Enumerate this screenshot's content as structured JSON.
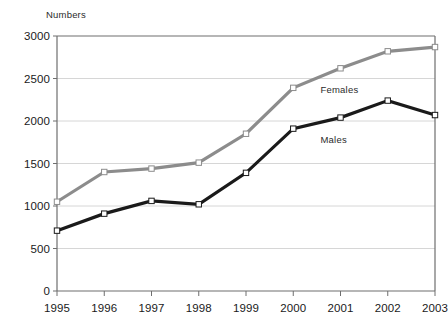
{
  "chart_data": {
    "type": "line",
    "title": "",
    "subtitle": "",
    "ylabel": "Numbers",
    "xlabel": "",
    "categories": [
      "1995",
      "1996",
      "1997",
      "1998",
      "1999",
      "2000",
      "2001",
      "2002",
      "2003"
    ],
    "x": [
      1995,
      1996,
      1997,
      1998,
      1999,
      2000,
      2001,
      2002,
      2003
    ],
    "series": [
      {
        "name": "Females",
        "color": "#8c8c8c",
        "values": [
          1050,
          1400,
          1440,
          1510,
          1850,
          2390,
          2620,
          2820,
          2870
        ]
      },
      {
        "name": "Males",
        "color": "#1a1a1a",
        "values": [
          710,
          910,
          1060,
          1020,
          1390,
          1910,
          2040,
          2240,
          2070
        ]
      }
    ],
    "ylim": [
      0,
      3000
    ],
    "yticks": [
      0,
      500,
      1000,
      1500,
      2000,
      2500,
      3000
    ],
    "ytick_labels": [
      "0",
      "500",
      "1000",
      "1500",
      "2000",
      "2500",
      "3000"
    ],
    "grid": true,
    "grid_axis": "y",
    "legend": "inline-labels",
    "marker": "square",
    "marker_face_color": "#ffffff",
    "plot_border_color": "#6e6e6e",
    "grid_color": "#d6d6d6",
    "background": "#ffffff"
  },
  "annotations": {
    "females_label": "Females",
    "males_label": "Males"
  }
}
